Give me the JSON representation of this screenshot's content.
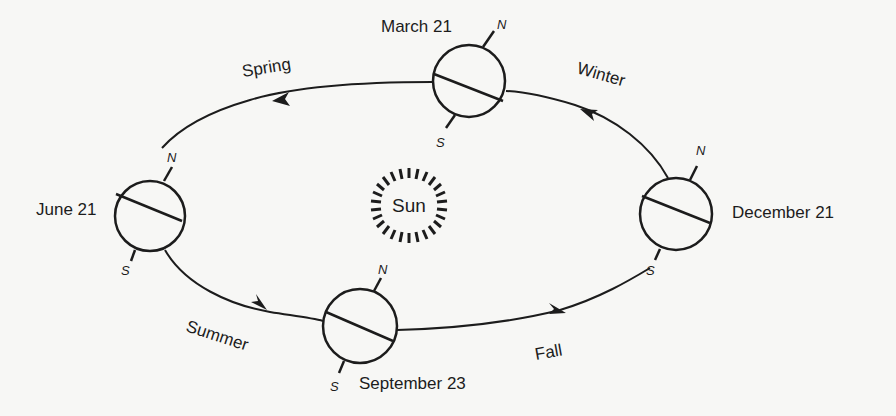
{
  "diagram": {
    "sun": {
      "label": "Sun"
    },
    "positions": [
      {
        "date": "March 21",
        "north_label": "N",
        "south_label": "S"
      },
      {
        "date": "June 21",
        "north_label": "N",
        "south_label": "S"
      },
      {
        "date": "September 23",
        "north_label": "N",
        "south_label": "S"
      },
      {
        "date": "December 21",
        "north_label": "N",
        "south_label": "S"
      }
    ],
    "seasons": [
      {
        "label": "Spring"
      },
      {
        "label": "Summer"
      },
      {
        "label": "Fall"
      },
      {
        "label": "Winter"
      }
    ],
    "colors": {
      "ink": "#1c1c1c",
      "paper": "#f7f7f5"
    }
  }
}
